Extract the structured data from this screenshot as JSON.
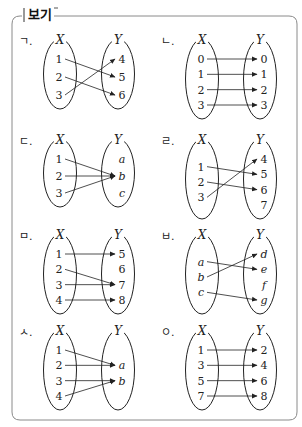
{
  "box": {
    "title": "보기",
    "border_color": "#8a8a8a"
  },
  "diagrams": [
    {
      "label": "ㄱ.",
      "set_x_name": "X",
      "set_y_name": "Y",
      "x_elements": [
        "1",
        "2",
        "3"
      ],
      "y_elements": [
        "4",
        "5",
        "6"
      ],
      "mappings": [
        [
          "1",
          "5"
        ],
        [
          "2",
          "6"
        ],
        [
          "3",
          "4"
        ]
      ],
      "italic": false
    },
    {
      "label": "ㄴ.",
      "set_x_name": "X",
      "set_y_name": "Y",
      "x_elements": [
        "0",
        "1",
        "2",
        "3"
      ],
      "y_elements": [
        "0",
        "1",
        "2",
        "3"
      ],
      "mappings": [
        [
          "0",
          "0"
        ],
        [
          "1",
          "1"
        ],
        [
          "2",
          "2"
        ],
        [
          "3",
          "3"
        ]
      ],
      "italic": false
    },
    {
      "label": "ㄷ.",
      "set_x_name": "X",
      "set_y_name": "Y",
      "x_elements": [
        "1",
        "2",
        "3"
      ],
      "y_elements": [
        "a",
        "b",
        "c"
      ],
      "mappings": [
        [
          "1",
          "b"
        ],
        [
          "2",
          "b"
        ],
        [
          "3",
          "b"
        ]
      ],
      "italic": false
    },
    {
      "label": "ㄹ.",
      "set_x_name": "X",
      "set_y_name": "Y",
      "x_elements": [
        "1",
        "2",
        "3"
      ],
      "y_elements": [
        "4",
        "5",
        "6",
        "7"
      ],
      "mappings": [
        [
          "1",
          "5"
        ],
        [
          "2",
          "6"
        ],
        [
          "3",
          "4"
        ]
      ],
      "italic": false
    },
    {
      "label": "ㅁ.",
      "set_x_name": "X",
      "set_y_name": "Y",
      "x_elements": [
        "1",
        "2",
        "3",
        "4"
      ],
      "y_elements": [
        "5",
        "6",
        "7",
        "8"
      ],
      "mappings": [
        [
          "1",
          "5"
        ],
        [
          "2",
          "7"
        ],
        [
          "3",
          "7"
        ],
        [
          "4",
          "8"
        ]
      ],
      "italic": false
    },
    {
      "label": "ㅂ.",
      "set_x_name": "X",
      "set_y_name": "Y",
      "x_elements": [
        "a",
        "b",
        "c"
      ],
      "y_elements": [
        "d",
        "e",
        "f",
        "g"
      ],
      "mappings": [
        [
          "a",
          "e"
        ],
        [
          "b",
          "d"
        ],
        [
          "c",
          "g"
        ]
      ],
      "italic": true
    },
    {
      "label": "ㅅ.",
      "set_x_name": "X",
      "set_y_name": "Y",
      "x_elements": [
        "1",
        "2",
        "3",
        "4"
      ],
      "y_elements": [
        "a",
        "b"
      ],
      "mappings": [
        [
          "1",
          "a"
        ],
        [
          "2",
          "a"
        ],
        [
          "3",
          "b"
        ],
        [
          "4",
          "b"
        ]
      ],
      "italic": false
    },
    {
      "label": "ㅇ.",
      "set_x_name": "X",
      "set_y_name": "Y",
      "x_elements": [
        "1",
        "3",
        "5",
        "7"
      ],
      "y_elements": [
        "2",
        "4",
        "6",
        "8"
      ],
      "mappings": [
        [
          "1",
          "2"
        ],
        [
          "3",
          "4"
        ],
        [
          "5",
          "6"
        ],
        [
          "7",
          "8"
        ]
      ],
      "italic": false
    }
  ]
}
